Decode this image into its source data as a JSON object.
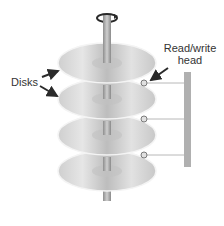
{
  "diagram": {
    "labels": {
      "disks": "Disks",
      "head_line1": "Read/write",
      "head_line2": "head"
    },
    "disks": [
      {
        "id": 1,
        "cy": 63
      },
      {
        "id": 2,
        "cy": 99
      },
      {
        "id": 3,
        "cy": 135
      },
      {
        "id": 4,
        "cy": 171
      }
    ],
    "heads": [
      {
        "id": 1,
        "cx": 144,
        "cy": 83
      },
      {
        "id": 2,
        "cx": 144,
        "cy": 119
      },
      {
        "id": 3,
        "cx": 144,
        "cy": 155
      }
    ],
    "colors": {
      "disk_fill": "#d6d6d6",
      "disk_edge": "#f2f2f2",
      "spindle": "#a9a9a9",
      "arm": "#b0b0b0",
      "arrow": "#2a2a2a",
      "text": "#333333"
    }
  }
}
